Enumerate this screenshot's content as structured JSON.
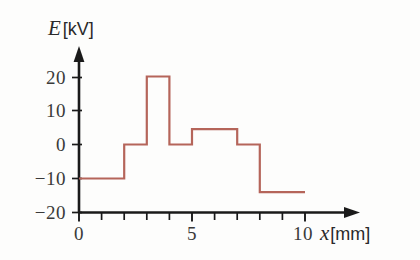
{
  "chart_data": {
    "type": "line",
    "title": "",
    "subtitle": "",
    "xlabel": "x [mm]",
    "ylabel": "E [kV]",
    "xlim": [
      0,
      10.8
    ],
    "ylim": [
      -20,
      23
    ],
    "grid": false,
    "legend": null,
    "series": [
      {
        "name": "E",
        "color": "#b5655a",
        "style": "step-post",
        "x": [
          0,
          2,
          2,
          3,
          3,
          4,
          4,
          5,
          5,
          7,
          7,
          8,
          8,
          10
        ],
        "y": [
          -10,
          -10,
          0,
          0,
          20,
          20,
          0,
          0,
          4.5,
          4.5,
          0,
          0,
          -14,
          -14
        ],
        "segments": [
          {
            "x_start": 0,
            "x_end": 2,
            "value": -10
          },
          {
            "x_start": 2,
            "x_end": 3,
            "value": 0
          },
          {
            "x_start": 3,
            "x_end": 4,
            "value": 20
          },
          {
            "x_start": 4,
            "x_end": 5,
            "value": 0
          },
          {
            "x_start": 5,
            "x_end": 7,
            "value": 4.5
          },
          {
            "x_start": 7,
            "x_end": 8,
            "value": 0
          },
          {
            "x_start": 8,
            "x_end": 10,
            "value": -14
          }
        ]
      }
    ],
    "yticks": [
      {
        "value": 20,
        "label": "20"
      },
      {
        "value": 10,
        "label": "10"
      },
      {
        "value": 0,
        "label": "0"
      },
      {
        "value": -10,
        "label": "−10"
      },
      {
        "value": -20,
        "label": "−20"
      }
    ],
    "xticks": [
      {
        "value": 0,
        "label": "0",
        "major": true
      },
      {
        "value": 1,
        "label": "",
        "major": false
      },
      {
        "value": 2,
        "label": "",
        "major": false
      },
      {
        "value": 3,
        "label": "",
        "major": false
      },
      {
        "value": 4,
        "label": "",
        "major": false
      },
      {
        "value": 5,
        "label": "5",
        "major": true
      },
      {
        "value": 6,
        "label": "",
        "major": false
      },
      {
        "value": 7,
        "label": "",
        "major": false
      },
      {
        "value": 8,
        "label": "",
        "major": false
      },
      {
        "value": 9,
        "label": "",
        "major": false
      },
      {
        "value": 10,
        "label": "10",
        "major": true
      }
    ]
  },
  "labels": {
    "y_axis_symbol": "E",
    "y_axis_unit": "[kV]",
    "x_axis_symbol": "x",
    "x_axis_unit": "[mm]",
    "y_tick_20": "20",
    "y_tick_10": "10",
    "y_tick_0": "0",
    "y_tick_neg10": "−10",
    "y_tick_neg20": "−20",
    "x_tick_0": "0",
    "x_tick_5": "5",
    "x_tick_10": "10"
  },
  "colors": {
    "curve": "#b5655a",
    "axis": "#1a1a1a",
    "text": "#3a3a3a",
    "background": "#fdfdfc"
  }
}
